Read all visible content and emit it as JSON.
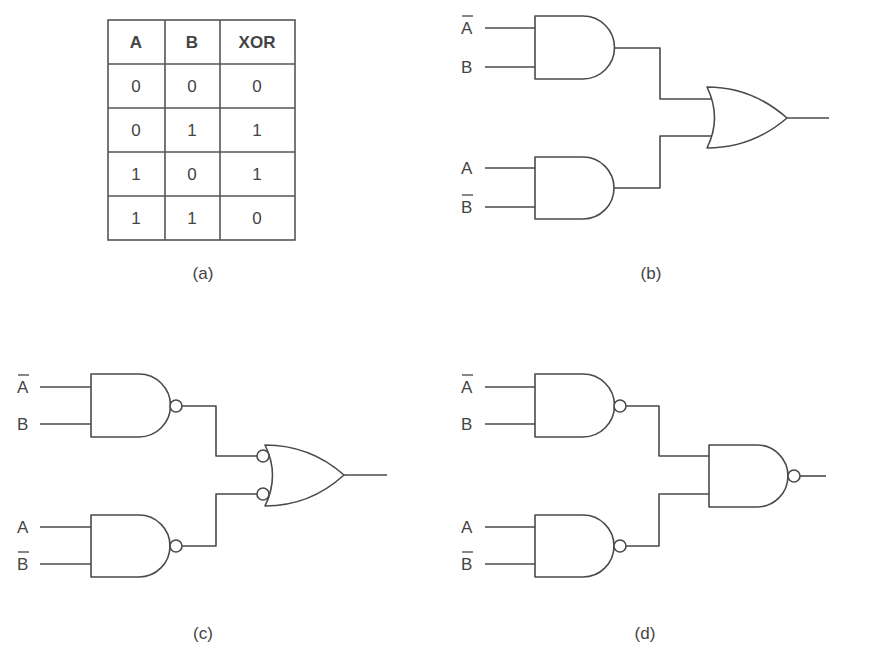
{
  "figure": {
    "panels": [
      {
        "id": "a",
        "caption": "(a)",
        "type": "truth-table",
        "title": "XOR truth table",
        "headers": [
          "A",
          "B",
          "XOR"
        ],
        "rows": [
          [
            "0",
            "0",
            "0"
          ],
          [
            "0",
            "1",
            "1"
          ],
          [
            "1",
            "0",
            "1"
          ],
          [
            "1",
            "1",
            "0"
          ]
        ]
      },
      {
        "id": "b",
        "caption": "(b)",
        "type": "circuit",
        "description": "Two AND gates feeding an OR gate",
        "inputs": [
          "A",
          "B",
          "A",
          "B"
        ],
        "inputs_inverted": [
          true,
          false,
          false,
          true
        ],
        "gates": [
          "AND",
          "AND",
          "OR"
        ]
      },
      {
        "id": "c",
        "caption": "(c)",
        "type": "circuit",
        "description": "Two NAND gates feeding an OR gate with inverted inputs",
        "inputs": [
          "A",
          "B",
          "A",
          "B"
        ],
        "inputs_inverted": [
          true,
          false,
          false,
          true
        ],
        "gates": [
          "NAND",
          "NAND",
          "OR (inverted inputs)"
        ]
      },
      {
        "id": "d",
        "caption": "(d)",
        "type": "circuit",
        "description": "Three NAND gates",
        "inputs": [
          "A",
          "B",
          "A",
          "B"
        ],
        "inputs_inverted": [
          true,
          false,
          false,
          true
        ],
        "gates": [
          "NAND",
          "NAND",
          "NAND"
        ]
      }
    ]
  }
}
